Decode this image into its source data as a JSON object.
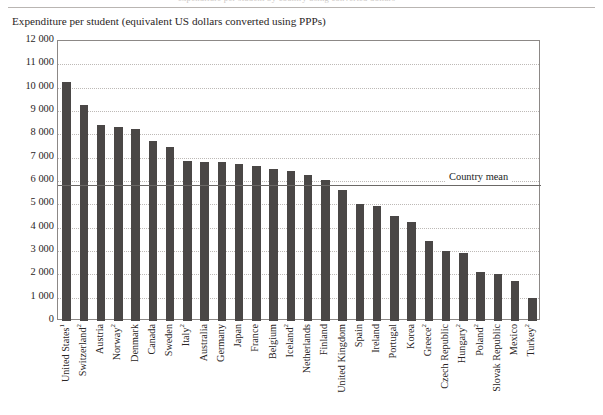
{
  "top_clipped_line": "expenditure per student by country using converted dollars",
  "chart_data": {
    "type": "bar",
    "title": "Expenditure per student (equivalent US dollars converted using PPPs)",
    "xlabel": "",
    "ylabel": "",
    "ylim": [
      0,
      12000
    ],
    "grid": true,
    "legend_position": "none",
    "ytick_labels": [
      "12 000",
      "11 000",
      "10 000",
      "9 000",
      "8 000",
      "7 000",
      "6 000",
      "5 000",
      "4 000",
      "3 000",
      "2 000",
      "1 000",
      "0"
    ],
    "ytick_values": [
      12000,
      11000,
      10000,
      9000,
      8000,
      7000,
      6000,
      5000,
      4000,
      3000,
      2000,
      1000,
      0
    ],
    "categories": [
      "United States",
      "Switzerland",
      "Austria",
      "Norway",
      "Denmark",
      "Canada",
      "Sweden",
      "Italy",
      "Australia",
      "Germany",
      "Japan",
      "France",
      "Belgium",
      "Iceland",
      "Netherlands",
      "Finland",
      "United Kingdom",
      "Spain",
      "Ireland",
      "Portugal",
      "Korea",
      "Greece",
      "Czech Republic",
      "Hungary",
      "Poland",
      "Slovak Republic",
      "Mexico",
      "Turkey"
    ],
    "category_footnotes": [
      "1",
      "2",
      "",
      "2",
      "",
      "",
      "",
      "2",
      "",
      "",
      "",
      "",
      "",
      "2",
      "",
      "",
      "",
      "",
      "",
      "",
      "",
      "2",
      "",
      "2",
      "2",
      "",
      "",
      "2"
    ],
    "values": [
      10250,
      9250,
      8400,
      8300,
      8250,
      7700,
      7450,
      6850,
      6800,
      6800,
      6750,
      6650,
      6500,
      6450,
      6250,
      6050,
      5600,
      5000,
      4950,
      4500,
      4250,
      3450,
      3000,
      2900,
      2100,
      2000,
      1700,
      1000
    ],
    "bar_color": "#4a4746",
    "annotations": [
      {
        "name": "country-mean",
        "label": "Country mean",
        "value": 5850,
        "style": "solid-line"
      }
    ]
  }
}
